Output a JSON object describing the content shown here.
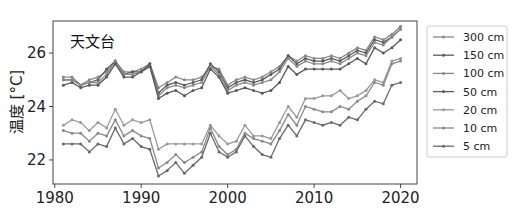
{
  "chart_data": {
    "type": "line",
    "title": "",
    "panel_label": "天文台",
    "xlabel": "",
    "ylabel": "温度 [°C]",
    "xlim": [
      1979.8,
      2021.9
    ],
    "ylim": [
      21.1,
      27.2
    ],
    "xticks": [
      1980,
      1990,
      2000,
      2010,
      2020
    ],
    "yticks": [
      22,
      24,
      26
    ],
    "grid": false,
    "legend_position": "outside-right",
    "x": [
      1981,
      1982,
      1983,
      1984,
      1985,
      1986,
      1987,
      1988,
      1989,
      1990,
      1991,
      1992,
      1993,
      1994,
      1995,
      1996,
      1997,
      1998,
      1999,
      2000,
      2001,
      2002,
      2003,
      2004,
      2005,
      2006,
      2007,
      2008,
      2009,
      2010,
      2011,
      2012,
      2013,
      2014,
      2015,
      2016,
      2017,
      2018,
      2019,
      2020
    ],
    "series": [
      {
        "name": "300 cm",
        "color": "#8a8a8a",
        "values": [
          25.1,
          25.1,
          24.8,
          25.0,
          25.1,
          25.3,
          25.7,
          25.3,
          25.3,
          25.4,
          25.6,
          24.7,
          24.9,
          25.1,
          25.0,
          25.0,
          25.1,
          25.5,
          25.4,
          24.8,
          25.0,
          25.1,
          25.0,
          25.1,
          25.3,
          25.5,
          25.9,
          25.7,
          25.9,
          25.8,
          25.8,
          25.9,
          25.8,
          26.0,
          26.2,
          26.1,
          26.6,
          26.5,
          26.7,
          27.0
        ]
      },
      {
        "name": "150 cm",
        "color": "#5a5a5a",
        "values": [
          25.0,
          25.0,
          24.8,
          24.9,
          25.0,
          25.4,
          25.7,
          25.2,
          25.3,
          25.3,
          25.6,
          24.5,
          24.8,
          24.9,
          24.8,
          24.9,
          25.0,
          25.6,
          25.3,
          24.7,
          24.9,
          25.0,
          24.9,
          25.0,
          25.2,
          25.4,
          25.9,
          25.6,
          25.8,
          25.7,
          25.7,
          25.8,
          25.7,
          25.9,
          26.1,
          26.0,
          26.5,
          26.4,
          26.6,
          26.9
        ]
      },
      {
        "name": "100 cm",
        "color": "#8a8a8a",
        "values": [
          25.0,
          25.0,
          24.8,
          24.9,
          24.9,
          25.2,
          25.7,
          25.2,
          25.2,
          25.3,
          25.5,
          24.4,
          24.7,
          24.8,
          24.7,
          24.8,
          24.9,
          25.5,
          25.2,
          24.6,
          24.8,
          24.9,
          24.8,
          24.9,
          25.0,
          25.3,
          25.8,
          25.5,
          25.7,
          25.6,
          25.6,
          25.7,
          25.6,
          25.8,
          26.0,
          25.9,
          26.4,
          26.3,
          26.6,
          26.9
        ]
      },
      {
        "name": "50 cm",
        "color": "#5a5a5a",
        "values": [
          24.8,
          24.9,
          24.7,
          24.8,
          24.8,
          25.1,
          25.6,
          25.1,
          25.1,
          25.3,
          25.5,
          24.3,
          24.5,
          24.6,
          24.4,
          24.6,
          24.7,
          25.4,
          25.1,
          24.5,
          24.6,
          24.7,
          24.6,
          24.5,
          24.6,
          24.9,
          25.5,
          25.2,
          25.4,
          25.4,
          25.4,
          25.4,
          25.4,
          25.6,
          25.8,
          25.6,
          26.2,
          26.0,
          26.2,
          26.5
        ]
      },
      {
        "name": "20 cm",
        "color": "#9a9a9a",
        "values": [
          23.3,
          23.5,
          23.4,
          23.1,
          23.4,
          23.2,
          23.9,
          23.3,
          23.5,
          23.4,
          23.5,
          22.4,
          22.6,
          22.6,
          22.6,
          22.6,
          22.6,
          23.3,
          22.9,
          22.6,
          22.7,
          23.3,
          22.9,
          22.9,
          22.8,
          23.4,
          24.0,
          23.6,
          24.3,
          24.3,
          24.4,
          24.4,
          24.6,
          24.3,
          24.4,
          24.6,
          25.0,
          24.9,
          25.7,
          25.8
        ]
      },
      {
        "name": "10 cm",
        "color": "#8a8a8a",
        "values": [
          23.1,
          23.0,
          23.0,
          22.7,
          23.0,
          22.9,
          23.5,
          22.9,
          23.1,
          22.9,
          22.8,
          21.7,
          21.9,
          22.2,
          21.9,
          22.1,
          22.3,
          23.2,
          22.5,
          22.2,
          22.4,
          23.0,
          22.8,
          22.7,
          22.6,
          23.1,
          23.7,
          23.3,
          24.0,
          23.9,
          23.8,
          23.8,
          24.0,
          23.9,
          24.2,
          24.4,
          24.9,
          24.8,
          25.6,
          25.7
        ]
      },
      {
        "name": "5 cm",
        "color": "#6a6a6a",
        "values": [
          22.6,
          22.6,
          22.6,
          22.3,
          22.6,
          22.5,
          23.2,
          22.6,
          22.8,
          22.5,
          22.4,
          21.4,
          21.6,
          21.9,
          21.5,
          21.8,
          22.1,
          23.0,
          22.3,
          22.1,
          22.3,
          22.9,
          22.5,
          22.2,
          22.1,
          22.8,
          23.3,
          22.9,
          23.5,
          23.4,
          23.3,
          23.4,
          23.3,
          23.6,
          23.5,
          23.9,
          24.2,
          24.1,
          24.8,
          24.9
        ]
      }
    ]
  }
}
